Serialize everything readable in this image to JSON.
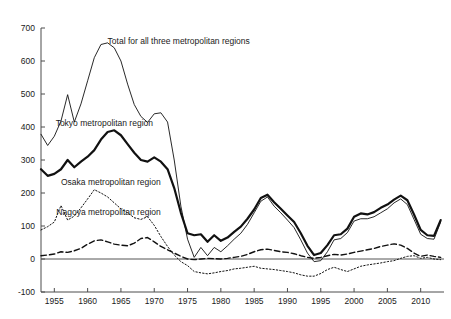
{
  "chart_data": {
    "type": "line",
    "title": "",
    "subtitle": "",
    "xlabel": "",
    "ylabel": "",
    "xlim": [
      1953,
      2013.5
    ],
    "ylim": [
      -100,
      700
    ],
    "y_ticks": [
      -100,
      0,
      100,
      200,
      300,
      400,
      500,
      600,
      700
    ],
    "y_tick_labels": [
      "-100",
      "0",
      "100",
      "200",
      "300",
      "400",
      "500",
      "600",
      "700"
    ],
    "x_ticks": [
      1955,
      1960,
      1965,
      1970,
      1975,
      1980,
      1985,
      1990,
      1995,
      2000,
      2005,
      2010
    ],
    "x_tick_labels": [
      "1955",
      "1960",
      "1965",
      "1970",
      "1975",
      "1980",
      "1985",
      "1990",
      "1995",
      "2000",
      "2005",
      "2010"
    ],
    "x_minor_step": 1,
    "grid": false,
    "legend_position": "inline-annotations",
    "zero_reference_line": 0,
    "annotations": [
      {
        "text": "Total for all three metropolitan regions",
        "x": 1963.0,
        "y": 652,
        "anchor": "start",
        "series": "total"
      },
      {
        "text": "Tokyo metropolitan region",
        "x": 1955.2,
        "y": 404,
        "anchor": "start",
        "series": "tokyo"
      },
      {
        "text": "Osaka metropolitan region",
        "x": 1956.0,
        "y": 224,
        "anchor": "start",
        "series": "osaka"
      },
      {
        "text": "Nagoya metropolitan region",
        "x": 1955.3,
        "y": 132,
        "anchor": "start",
        "series": "nagoya"
      }
    ],
    "x": [
      1953,
      1954,
      1955,
      1956,
      1957,
      1958,
      1959,
      1960,
      1961,
      1962,
      1963,
      1964,
      1965,
      1966,
      1967,
      1968,
      1969,
      1970,
      1971,
      1972,
      1973,
      1974,
      1975,
      1976,
      1977,
      1978,
      1979,
      1980,
      1981,
      1982,
      1983,
      1984,
      1985,
      1986,
      1987,
      1988,
      1989,
      1990,
      1991,
      1992,
      1993,
      1994,
      1995,
      1996,
      1997,
      1998,
      1999,
      2000,
      2001,
      2002,
      2003,
      2004,
      2005,
      2006,
      2007,
      2008,
      2009,
      2010,
      2011,
      2012,
      2013
    ],
    "series": [
      {
        "name": "Total for all three metropolitan regions",
        "key": "total",
        "style": "thin-solid",
        "color": "#1a1a1a",
        "linewidth": 0.9,
        "values": [
          378,
          344,
          372,
          418,
          498,
          415,
          470,
          540,
          610,
          650,
          655,
          640,
          600,
          530,
          468,
          432,
          414,
          440,
          443,
          415,
          300,
          160,
          60,
          5,
          35,
          10,
          35,
          22,
          40,
          60,
          78,
          105,
          140,
          175,
          188,
          160,
          140,
          118,
          95,
          58,
          18,
          -8,
          -5,
          22,
          58,
          62,
          80,
          115,
          122,
          122,
          128,
          140,
          152,
          170,
          182,
          165,
          120,
          75,
          62,
          60,
          112
        ]
      },
      {
        "name": "Tokyo metropolitan region",
        "key": "tokyo",
        "style": "thick-solid",
        "color": "#0d0d0d",
        "linewidth": 2.2,
        "values": [
          272,
          252,
          258,
          272,
          300,
          278,
          295,
          310,
          330,
          362,
          385,
          390,
          375,
          348,
          322,
          300,
          295,
          308,
          295,
          272,
          215,
          140,
          78,
          72,
          75,
          52,
          72,
          55,
          65,
          82,
          98,
          122,
          150,
          185,
          195,
          172,
          152,
          132,
          112,
          78,
          40,
          12,
          18,
          42,
          72,
          75,
          92,
          128,
          138,
          135,
          142,
          155,
          165,
          180,
          192,
          178,
          135,
          88,
          72,
          70,
          118
        ]
      },
      {
        "name": "Osaka metropolitan region",
        "key": "osaka",
        "style": "dotted",
        "color": "#333333",
        "linewidth": 1.0,
        "values": [
          88,
          98,
          112,
          162,
          118,
          130,
          155,
          182,
          210,
          200,
          188,
          170,
          152,
          140,
          125,
          120,
          128,
          102,
          68,
          38,
          12,
          -8,
          -20,
          -38,
          -42,
          -45,
          -42,
          -38,
          -35,
          -30,
          -28,
          -25,
          -22,
          -28,
          -30,
          -32,
          -35,
          -38,
          -42,
          -48,
          -52,
          -52,
          -44,
          -32,
          -25,
          -32,
          -38,
          -30,
          -22,
          -18,
          -15,
          -12,
          -8,
          -5,
          2,
          8,
          10,
          2,
          5,
          0,
          -2
        ]
      },
      {
        "name": "Nagoya metropolitan region",
        "key": "nagoya",
        "style": "dashed",
        "color": "#2b2b2b",
        "linewidth": 1.4,
        "values": [
          10,
          12,
          15,
          22,
          20,
          25,
          32,
          45,
          55,
          58,
          52,
          45,
          42,
          40,
          48,
          62,
          65,
          52,
          38,
          28,
          18,
          8,
          0,
          -2,
          0,
          2,
          1,
          0,
          2,
          5,
          8,
          14,
          22,
          28,
          30,
          26,
          22,
          20,
          16,
          10,
          5,
          2,
          5,
          10,
          14,
          12,
          15,
          20,
          24,
          28,
          32,
          38,
          42,
          46,
          42,
          32,
          18,
          8,
          12,
          8,
          5
        ]
      }
    ]
  },
  "meta": {
    "axis_color": "#4d4d4d",
    "background": "#ffffff"
  }
}
